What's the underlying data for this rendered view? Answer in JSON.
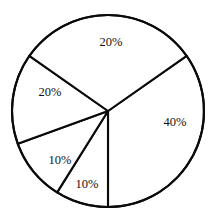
{
  "chart_data": {
    "type": "pie",
    "title": "",
    "subtitle": "",
    "xlabel": "",
    "ylabel": "",
    "legend": null,
    "grid": false,
    "units": "percent",
    "total": 100,
    "stroke_color": "#0a0a0a",
    "fill_color": "#ffffff",
    "categories": [
      "Slice 1",
      "Slice 2",
      "Slice 3",
      "Slice 4",
      "Slice 5"
    ],
    "values": [
      40,
      10,
      10,
      20,
      20
    ],
    "labels": [
      "40%",
      "10%",
      "10%",
      "20%",
      "20%"
    ],
    "slices": [
      {
        "label": "40%",
        "value": 40,
        "start_angle_deg": -35,
        "end_angle_deg": 90,
        "label_x": 175,
        "label_y": 122
      },
      {
        "label": "10%",
        "value": 10,
        "start_angle_deg": 90,
        "end_angle_deg": 122,
        "label_x": 87,
        "label_y": 184
      },
      {
        "label": "10%",
        "value": 10,
        "start_angle_deg": 122,
        "end_angle_deg": 160,
        "label_x": 60,
        "label_y": 160
      },
      {
        "label": "20%",
        "value": 20,
        "start_angle_deg": 160,
        "end_angle_deg": 215,
        "label_x": 50,
        "label_y": 92
      },
      {
        "label": "20%",
        "value": 20,
        "start_angle_deg": 215,
        "end_angle_deg": 325,
        "label_x": 111,
        "label_y": 42
      }
    ],
    "geometry": {
      "center_x": 108,
      "center_y": 111,
      "radius": 96
    }
  }
}
